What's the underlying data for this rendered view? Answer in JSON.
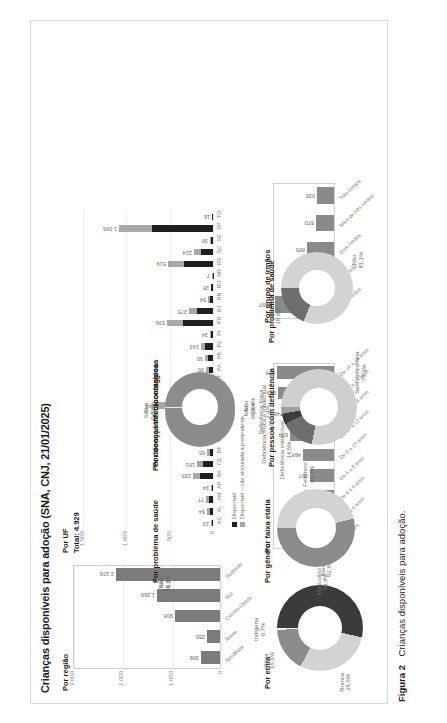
{
  "figure": {
    "title": "Crianças disponíveis para adoção (SNA, CNJ, 21/01/2025)",
    "caption_label": "Figura 2",
    "caption_text": "Crianças disponíveis para adoção."
  },
  "panels": {
    "regiao": {
      "title": "Por região",
      "axis_ticks": [
        "3.000",
        "2.000",
        "1.000",
        "0"
      ],
      "categories": [
        "Nordeste",
        "Norte",
        "Centro-Oeste",
        "Sul",
        "Sudeste"
      ],
      "values": [
        386,
        255,
        908,
        1269,
        2109
      ],
      "value_labels": [
        "386",
        "255",
        "908",
        "1.269",
        "2.109"
      ]
    },
    "uf": {
      "title": "Por UF",
      "total_label": "Total: 4.929",
      "axis_ticks": [
        "1.500",
        "1.000",
        "500",
        "0"
      ],
      "legend": [
        "Disponível",
        "Disponível – não vinculada a pretendente"
      ],
      "categories": [
        "AC",
        "AL",
        "AM",
        "AP",
        "BA",
        "CE",
        "DF",
        "ES",
        "GO",
        "MA",
        "MG",
        "MS",
        "MT",
        "PA",
        "PB",
        "PE",
        "PI",
        "PR",
        "RJ",
        "RN",
        "RO",
        "RR",
        "RS",
        "SC",
        "SE",
        "SP",
        "TO"
      ],
      "value_labels": [
        "23",
        "64",
        "77",
        "24",
        "235",
        "181",
        "65",
        "107",
        "124",
        "69",
        "649",
        "141",
        "56",
        "80",
        "90",
        "143",
        "34",
        "536",
        "275",
        "54",
        "28",
        "7",
        "519",
        "214",
        "38",
        "1.086",
        "16"
      ],
      "values": [
        23,
        64,
        77,
        24,
        235,
        181,
        65,
        107,
        124,
        69,
        649,
        141,
        56,
        80,
        90,
        143,
        34,
        536,
        275,
        54,
        28,
        7,
        519,
        214,
        38,
        1086,
        16
      ]
    },
    "faixa_etaria": {
      "title": "Por faixa etária",
      "categories": [
        "Até 2 anos",
        "De 2 a 4 anos",
        "De 4 a 6 anos",
        "De 6 a 8 anos",
        "De 8 a 10 anos",
        "De 10 a 12 anos",
        "De 12 a 14 anos",
        "De 14 a 16 anos",
        "De 16 a 18 anos"
      ],
      "values": [
        189,
        296,
        452,
        367,
        468,
        674,
        746,
        859,
        878
      ],
      "value_labels": [
        "189",
        "296",
        "452",
        "367",
        "468",
        "674",
        "746",
        "859",
        "878"
      ]
    },
    "grupo_irmaos": {
      "title": "Por grupo de irmãos",
      "categories": [
        "Sem irmãos",
        "Um irmão",
        "Dois irmãos",
        "Mais de três irmãos",
        "Três irmãos"
      ],
      "values": [
        1897,
        1042,
        885,
        570,
        535
      ],
      "value_labels": [
        "1.897",
        "1.042",
        "885",
        "570",
        "535"
      ]
    },
    "etnia": {
      "title": "Por etnia",
      "slices": [
        {
          "label": "Parda",
          "pct": "52,8%",
          "value": 52.8,
          "color": "#3b3b3b"
        },
        {
          "label": "Branca",
          "pct": "28,6%",
          "value": 28.6,
          "color": "#d3d3d3"
        },
        {
          "label": "Preta",
          "pct": "16,6%",
          "value": 16.6,
          "color": "#8c8c8c"
        },
        {
          "label": "Indígena",
          "pct": "0,7%",
          "value": 0.7,
          "color": "#f0f0f0"
        }
      ]
    },
    "genero": {
      "title": "Por gênero",
      "slices": [
        {
          "label": "Feminino",
          "pct": "46,1%",
          "value": 46.1,
          "color": "#d3d3d3"
        },
        {
          "label": "Masculino",
          "pct": "53,9%",
          "value": 53.9,
          "color": "#8c8c8c"
        }
      ]
    },
    "doenca": {
      "title": "Por doença infectocontagiosa",
      "slices": [
        {
          "label": "Não",
          "pct": "99,4%",
          "value": 99.4,
          "color": "#8c8c8c"
        },
        {
          "label": "Sim",
          "pct": "0,6%",
          "value": 0.6,
          "color": "#e8e8e8"
        }
      ]
    },
    "deficiencia": {
      "title": "Por pessoa com deficiência",
      "slices": [
        {
          "label": "Sem deficiência",
          "pct": "78,3%",
          "value": 78.3,
          "color": "#cfcfcf"
        },
        {
          "label": "Deficiência intelectual",
          "pct": "14,5%",
          "value": 14.5,
          "color": "#6e6e6e"
        },
        {
          "label": "Deficiência física e intelectual",
          "pct": "4,6%",
          "value": 4.6,
          "color": "#3b3b3b"
        },
        {
          "label": "Deficiência física",
          "pct": "2,9%",
          "value": 2.9,
          "color": "#9e9e9e"
        }
      ]
    },
    "saude": {
      "title": "Por problema de saúde",
      "slices": [
        {
          "label": "Não",
          "pct": "81,1%",
          "value": 81.1,
          "color": "#d3d3d3"
        },
        {
          "label": "Sim",
          "pct": "18,9%",
          "value": 18.9,
          "color": "#6e6e6e"
        }
      ]
    }
  },
  "chart_data": [
    {
      "type": "bar",
      "title": "Por região",
      "categories": [
        "Nordeste",
        "Norte",
        "Centro-Oeste",
        "Sul",
        "Sudeste"
      ],
      "values": [
        386,
        255,
        908,
        1269,
        2109
      ],
      "xlabel": "",
      "ylabel": "",
      "ylim": [
        0,
        3000
      ],
      "ticks": [
        0,
        1000,
        2000,
        3000
      ],
      "grid": true,
      "legend": "none"
    },
    {
      "type": "bar",
      "title": "Por UF",
      "subtitle": "Total: 4.929",
      "categories": [
        "AC",
        "AL",
        "AM",
        "AP",
        "BA",
        "CE",
        "DF",
        "ES",
        "GO",
        "MA",
        "MG",
        "MS",
        "MT",
        "PA",
        "PB",
        "PE",
        "PI",
        "PR",
        "RJ",
        "RN",
        "RO",
        "RR",
        "RS",
        "SC",
        "SE",
        "SP",
        "TO"
      ],
      "series": [
        {
          "name": "Disponível",
          "values": [
            23,
            64,
            77,
            24,
            235,
            181,
            65,
            107,
            124,
            69,
            649,
            141,
            56,
            80,
            90,
            143,
            34,
            536,
            275,
            54,
            28,
            7,
            519,
            214,
            38,
            1086,
            16
          ]
        },
        {
          "name": "Disponível – não vinculada a pretendente",
          "values": [
            14,
            40,
            50,
            15,
            150,
            120,
            40,
            70,
            80,
            44,
            420,
            95,
            36,
            52,
            58,
            92,
            22,
            350,
            180,
            35,
            18,
            5,
            340,
            140,
            25,
            700,
            10
          ]
        }
      ],
      "xlabel": "",
      "ylabel": "",
      "ylim": [
        0,
        1500
      ],
      "ticks": [
        0,
        500,
        1000,
        1500
      ],
      "grid": true,
      "legend": "bottom",
      "stacked": true
    },
    {
      "type": "bar",
      "title": "Por faixa etária",
      "categories": [
        "Até 2 anos",
        "De 2 a 4 anos",
        "De 4 a 6 anos",
        "De 6 a 8 anos",
        "De 8 a 10 anos",
        "De 10 a 12 anos",
        "De 12 a 14 anos",
        "De 14 a 16 anos",
        "De 16 a 18 anos"
      ],
      "values": [
        189,
        296,
        452,
        367,
        468,
        674,
        746,
        859,
        878
      ],
      "xlabel": "",
      "ylabel": "",
      "ylim": [
        0,
        950
      ],
      "grid": false,
      "legend": "none"
    },
    {
      "type": "bar",
      "title": "Por grupo de irmãos",
      "categories": [
        "Sem irmãos",
        "Um irmão",
        "Dois irmãos",
        "Mais de três irmãos",
        "Três irmãos"
      ],
      "values": [
        1897,
        1042,
        885,
        570,
        535
      ],
      "xlabel": "",
      "ylabel": "",
      "ylim": [
        0,
        2000
      ],
      "grid": false,
      "legend": "none"
    },
    {
      "type": "pie",
      "title": "Por etnia",
      "labels": [
        "Parda",
        "Branca",
        "Preta",
        "Indígena"
      ],
      "values": [
        52.8,
        28.6,
        16.6,
        0.7
      ],
      "data_labels": [
        "52,8%",
        "28,6%",
        "16,6%",
        "0,7%"
      ],
      "donut": true
    },
    {
      "type": "pie",
      "title": "Por gênero",
      "labels": [
        "Masculino",
        "Feminino"
      ],
      "values": [
        53.9,
        46.1
      ],
      "data_labels": [
        "53,9%",
        "46,1%"
      ],
      "donut": true
    },
    {
      "type": "pie",
      "title": "Por doença infectocontagiosa",
      "labels": [
        "Não",
        "Sim"
      ],
      "values": [
        99.4,
        0.6
      ],
      "data_labels": [
        "99,4%",
        "0,6%"
      ],
      "donut": true
    },
    {
      "type": "pie",
      "title": "Por pessoa com deficiência",
      "labels": [
        "Sem deficiência",
        "Deficiência intelectual",
        "Deficiência física e intelectual",
        "Deficiência física"
      ],
      "values": [
        78.3,
        14.5,
        4.6,
        2.9
      ],
      "data_labels": [
        "78,3%",
        "14,5%",
        "4,6%",
        "2,9%"
      ],
      "donut": true
    },
    {
      "type": "pie",
      "title": "Por problema de saúde",
      "labels": [
        "Não",
        "Sim"
      ],
      "values": [
        81.1,
        18.9
      ],
      "data_labels": [
        "81,1%",
        "18,9%"
      ],
      "donut": true
    }
  ]
}
